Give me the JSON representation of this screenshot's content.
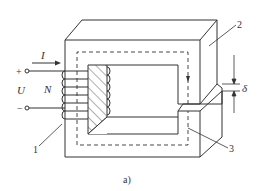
{
  "figure": {
    "caption": "a)",
    "type": "magnetic circuit with air gap",
    "colors": {
      "line": "#333333",
      "background": "#ffffff"
    }
  },
  "labels": {
    "current": "I",
    "voltage": "U",
    "turns": "N",
    "plus": "+",
    "minus": "−",
    "gap": "δ",
    "part_coil": "1",
    "part_core_top": "2",
    "part_core_right": "3"
  }
}
